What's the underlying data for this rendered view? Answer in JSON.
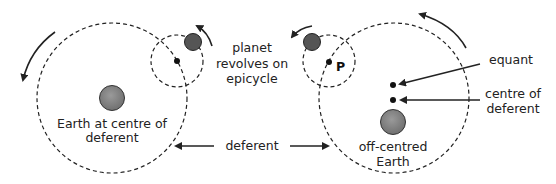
{
  "diagram": {
    "left_panel": {
      "earth_label_line1": "Earth at centre of",
      "earth_label_line2": "deferent"
    },
    "center_labels": {
      "epicycle_line1": "planet",
      "epicycle_line2": "revolves on",
      "epicycle_line3": "epicycle",
      "deferent": "deferent"
    },
    "right_panel": {
      "point_label": "P",
      "equant_label": "equant",
      "centre_label_line1": "centre of",
      "centre_label_line2": "deferent",
      "earth_label_line1": "off-centred",
      "earth_label_line2": "Earth"
    },
    "colors": {
      "line": "#222222",
      "planet_fill": "#555555",
      "earth_fill": "#8a8a8a",
      "background": "#ffffff"
    }
  }
}
